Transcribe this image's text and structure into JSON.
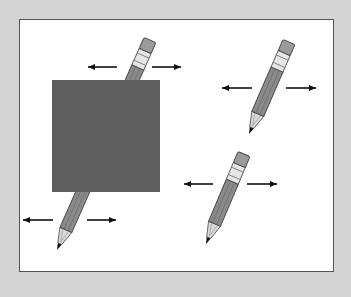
{
  "figure": {
    "colors": {
      "frame": "#d4d4d4",
      "panel": "#ffffff",
      "panel_border": "#555555",
      "occluder": "#5e5e5e",
      "pencil_body": "#8a8a8a",
      "pencil_body_dark": "#6e6e6e",
      "pencil_band": "#e6e6e6",
      "pencil_eraser": "#9a9a9a",
      "pencil_wood": "#d8d8d8",
      "pencil_lead": "#111111",
      "arrow": "#111111"
    },
    "occluder": {
      "x": 52,
      "y": 80,
      "width": 108,
      "height": 112
    },
    "pencils": [
      {
        "id": "occluded-pencil",
        "tip": [
          57,
          250
        ],
        "top": [
          150,
          40
        ]
      },
      {
        "id": "top-right-pencil",
        "tip": [
          249,
          134
        ],
        "top": [
          289,
          42
        ]
      },
      {
        "id": "bottom-right-pencil",
        "tip": [
          206,
          244
        ],
        "top": [
          244,
          154
        ]
      }
    ],
    "arrow_pairs": [
      {
        "id": "occluded-top-arrows",
        "y": 67,
        "left": [
          88,
          117
        ],
        "right": [
          152,
          181
        ]
      },
      {
        "id": "occluded-bottom-arrows",
        "y": 220,
        "left": [
          23,
          53
        ],
        "right": [
          87,
          116
        ]
      },
      {
        "id": "top-right-arrows",
        "y": 88,
        "left": [
          222,
          252
        ],
        "right": [
          286,
          316
        ]
      },
      {
        "id": "bottom-right-arrows",
        "y": 184,
        "left": [
          184,
          213
        ],
        "right": [
          247,
          277
        ]
      }
    ]
  }
}
